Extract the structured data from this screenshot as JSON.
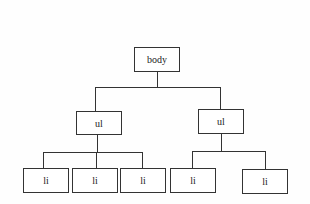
{
  "diagram": {
    "type": "tree",
    "root": {
      "label": "body",
      "children": [
        {
          "label": "ul",
          "children": [
            {
              "label": "li"
            },
            {
              "label": "li"
            },
            {
              "label": "li"
            }
          ]
        },
        {
          "label": "ul",
          "children": [
            {
              "label": "li"
            },
            {
              "label": "li"
            }
          ]
        }
      ]
    },
    "nodes": {
      "body": "body",
      "ul_left": "ul",
      "ul_right": "ul",
      "li_1": "li",
      "li_2": "li",
      "li_3": "li",
      "li_4": "li",
      "li_5": "li"
    }
  }
}
